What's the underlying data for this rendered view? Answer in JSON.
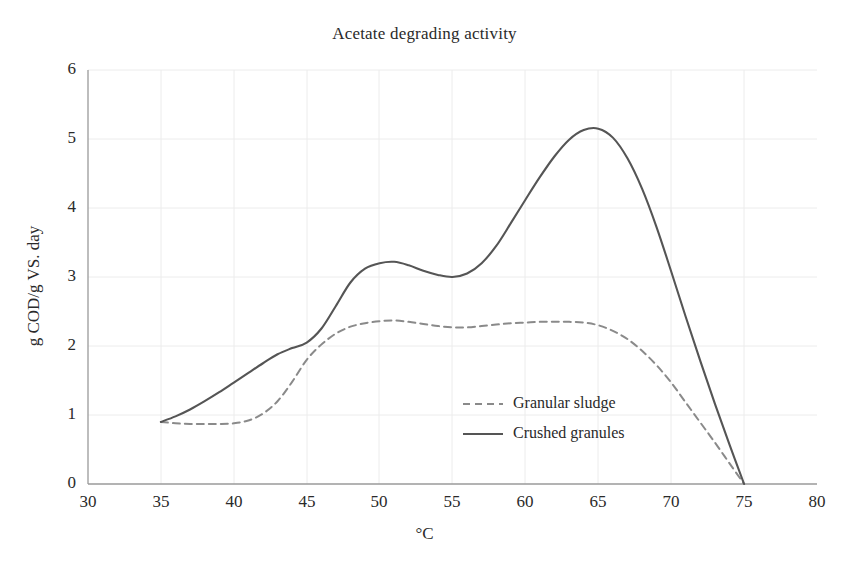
{
  "chart_data": {
    "type": "line",
    "title": "Acetate degrading activity",
    "xlabel": "°C",
    "ylabel": "g COD/g VS. day",
    "xlim": [
      30,
      80
    ],
    "ylim": [
      0,
      6
    ],
    "xticks": [
      "30",
      "35",
      "40",
      "45",
      "50",
      "55",
      "60",
      "65",
      "70",
      "75",
      "80"
    ],
    "yticks": [
      "0",
      "1",
      "2",
      "3",
      "4",
      "5",
      "6"
    ],
    "grid": true,
    "legend_position": "center-right-inside",
    "series": [
      {
        "name": "Granular sludge",
        "style": "dashed",
        "color": "#8a8a8a",
        "x": [
          35,
          36,
          37,
          38,
          39,
          40,
          41,
          42,
          43,
          44,
          45,
          46,
          47,
          48,
          49,
          50,
          51,
          52,
          53,
          54,
          55,
          56,
          57,
          58,
          59,
          60,
          61,
          62,
          63,
          64,
          65,
          66,
          67,
          68,
          69,
          70,
          71,
          72,
          73,
          74,
          75
        ],
        "y": [
          0.9,
          0.88,
          0.87,
          0.87,
          0.87,
          0.88,
          0.92,
          1.02,
          1.2,
          1.48,
          1.8,
          2.02,
          2.18,
          2.28,
          2.33,
          2.36,
          2.37,
          2.35,
          2.32,
          2.29,
          2.27,
          2.27,
          2.29,
          2.31,
          2.33,
          2.34,
          2.35,
          2.35,
          2.35,
          2.34,
          2.3,
          2.22,
          2.1,
          1.93,
          1.72,
          1.47,
          1.18,
          0.89,
          0.6,
          0.3,
          0.0
        ]
      },
      {
        "name": "Crushed granules",
        "style": "solid",
        "color": "#555555",
        "x": [
          35,
          36,
          37,
          38,
          39,
          40,
          41,
          42,
          43,
          44,
          45,
          46,
          47,
          48,
          49,
          50,
          51,
          52,
          53,
          54,
          55,
          56,
          57,
          58,
          59,
          60,
          61,
          62,
          63,
          64,
          65,
          66,
          67,
          68,
          69,
          70,
          71,
          72,
          73,
          74,
          75
        ],
        "y": [
          0.9,
          0.98,
          1.08,
          1.2,
          1.33,
          1.47,
          1.61,
          1.75,
          1.88,
          1.97,
          2.05,
          2.25,
          2.58,
          2.92,
          3.12,
          3.2,
          3.22,
          3.17,
          3.09,
          3.03,
          3.0,
          3.05,
          3.2,
          3.45,
          3.78,
          4.12,
          4.45,
          4.75,
          4.99,
          5.13,
          5.15,
          5.02,
          4.72,
          4.28,
          3.72,
          3.08,
          2.42,
          1.78,
          1.16,
          0.57,
          0.0
        ]
      }
    ],
    "annotations": {
      "crushed_peak_value": 5.15,
      "crushed_peak_temp": 64,
      "crushed_shoulder_value": 3.22,
      "crushed_shoulder_temp": 51,
      "crushed_dip_value": 3.0,
      "crushed_dip_temp": 55,
      "granular_plateau_value": 2.35,
      "common_start_value": 0.9,
      "common_start_temp": 35,
      "common_end_temp": 75
    }
  },
  "legend": {
    "entries": [
      {
        "label": "Granular sludge",
        "swatch": "dashed-line-swatch"
      },
      {
        "label": "Crushed granules",
        "swatch": "solid-line-swatch"
      }
    ]
  },
  "colors": {
    "solid_line": "#555555",
    "dashed_line": "#8a8a8a",
    "axis": "#9a9a9a",
    "grid": "#ececec",
    "text": "#2a2a2a",
    "background": "#ffffff"
  }
}
